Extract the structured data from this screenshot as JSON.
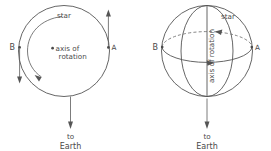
{
  "figure": {
    "background_color": "#ffffff",
    "line_color": "#555555",
    "text_color": "#4a4a4a"
  },
  "panels": [
    {
      "id": "left-panel",
      "view": "pole-on view of rotating star",
      "labels": {
        "star": "star",
        "axis_line1": "axis of",
        "axis_line2": "rotation",
        "point_a": "A",
        "point_b": "B",
        "to_line1": "to",
        "to_line2": "Earth"
      }
    },
    {
      "id": "right-panel",
      "view": "oblique view of rotating star sphere",
      "labels": {
        "star": "star",
        "axis_rotated": "axis of rotation",
        "point_a": "A",
        "point_b": "B",
        "to_line1": "to",
        "to_line2": "Earth"
      }
    }
  ]
}
